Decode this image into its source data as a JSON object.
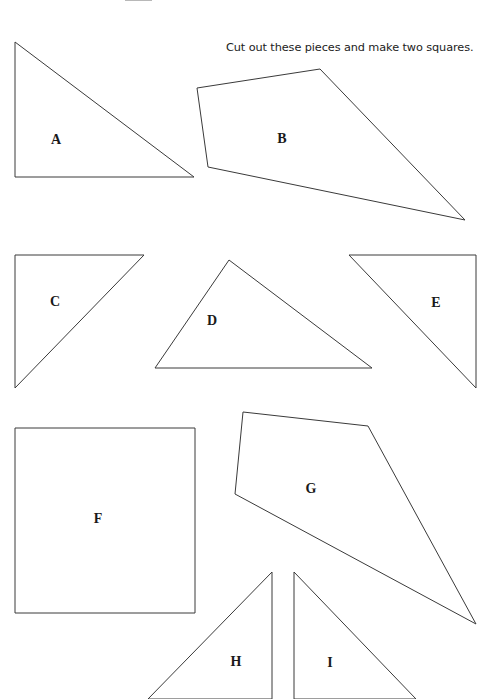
{
  "worksheet": {
    "instruction": "Cut out these pieces and make two squares.",
    "pieces": [
      {
        "label": "A",
        "shape": "right-triangle",
        "points": "15,42 15,177 194,177",
        "label_pos": [
          56,
          140
        ]
      },
      {
        "label": "B",
        "shape": "quadrilateral",
        "points": "197,88 320,69 465,220 208,167",
        "label_pos": [
          282,
          139
        ]
      },
      {
        "label": "C",
        "shape": "right-triangle",
        "points": "15,255 144,255 15,388",
        "label_pos": [
          55,
          302
        ]
      },
      {
        "label": "D",
        "shape": "triangle",
        "points": "229,260 155,368 372,368",
        "label_pos": [
          212,
          321
        ]
      },
      {
        "label": "E",
        "shape": "right-triangle",
        "points": "349,255 476,255 476,388",
        "label_pos": [
          436,
          303
        ]
      },
      {
        "label": "F",
        "shape": "square",
        "points": "15,428 195,428 195,613 15,613",
        "label_pos": [
          98,
          519
        ]
      },
      {
        "label": "G",
        "shape": "quadrilateral",
        "points": "243,412 368,426 476,624 235,494",
        "label_pos": [
          311,
          489
        ]
      },
      {
        "label": "H",
        "shape": "right-triangle",
        "points": "272,572 272,699 148,699",
        "label_pos": [
          236,
          662
        ]
      },
      {
        "label": "I",
        "shape": "right-triangle",
        "points": "294,572 294,699 416,699",
        "label_pos": [
          330,
          663
        ]
      }
    ],
    "colors": {
      "background": "#ffffff",
      "outline": "#3a3a3a",
      "text": "#1a1a1a"
    }
  }
}
